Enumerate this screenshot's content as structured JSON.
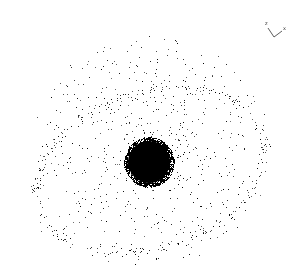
{
  "view": {
    "background": "#ffffff",
    "point_color": "#000000",
    "width": 302,
    "height": 279
  },
  "point_cloud": {
    "core": {
      "cx": 149,
      "cy": 162,
      "r": 25,
      "count": 2600
    },
    "halo": {
      "cx": 150,
      "cy": 150,
      "rx": 120,
      "ry": 115,
      "count": 650
    },
    "ring": {
      "cx": 150,
      "cy": 170,
      "rx": 118,
      "ry": 78,
      "tilt_deg": -18,
      "count": 260
    },
    "seed": 7
  },
  "axis_triad": {
    "labels": {
      "a": "z",
      "b": "x"
    },
    "color": "#333333"
  }
}
